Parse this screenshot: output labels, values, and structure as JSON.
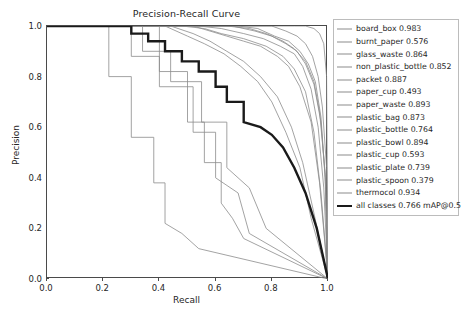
{
  "chart_data": {
    "type": "line",
    "title": "Precision-Recall Curve",
    "xlabel": "Recall",
    "ylabel": "Precision",
    "xlim": [
      0.0,
      1.0
    ],
    "ylim": [
      0.0,
      1.0
    ],
    "xticks": [
      "0.0",
      "0.2",
      "0.4",
      "0.6",
      "0.8",
      "1.0"
    ],
    "yticks": [
      "0.0",
      "0.2",
      "0.4",
      "0.6",
      "0.8",
      "1.0"
    ],
    "xtick_values": [
      0.0,
      0.2,
      0.4,
      0.6,
      0.8,
      1.0
    ],
    "ytick_values": [
      0.0,
      0.2,
      0.4,
      0.6,
      0.8,
      1.0
    ],
    "grid": false,
    "legend_position": "outside-right",
    "metric": "mAP@0.5",
    "series": [
      {
        "name": "board_box",
        "label": "board_box 0.983",
        "ap": 0.983,
        "color": "#8c8c8c",
        "width": 0.8,
        "x": [
          0.0,
          0.62,
          0.7,
          0.78,
          0.84,
          0.88,
          0.92,
          0.95,
          0.97,
          0.985,
          0.995,
          1.0
        ],
        "y": [
          1.0,
          1.0,
          1.0,
          1.0,
          1.0,
          1.0,
          1.0,
          0.99,
          0.97,
          0.93,
          0.8,
          0.0
        ]
      },
      {
        "name": "burnt_paper",
        "label": "burnt_paper 0.576",
        "ap": 0.576,
        "color": "#8c8c8c",
        "width": 0.8,
        "x": [
          0.0,
          0.3,
          0.3,
          0.4,
          0.4,
          0.52,
          0.52,
          0.6,
          0.6,
          0.68,
          0.72,
          1.0
        ],
        "y": [
          1.0,
          1.0,
          0.88,
          0.88,
          0.76,
          0.76,
          0.58,
          0.58,
          0.4,
          0.34,
          0.18,
          0.0
        ]
      },
      {
        "name": "glass_waste",
        "label": "glass_waste 0.864",
        "ap": 0.864,
        "color": "#8c8c8c",
        "width": 0.8,
        "x": [
          0.0,
          0.52,
          0.58,
          0.64,
          0.7,
          0.76,
          0.82,
          0.86,
          0.9,
          0.94,
          0.97,
          1.0
        ],
        "y": [
          1.0,
          1.0,
          0.98,
          0.96,
          0.94,
          0.92,
          0.88,
          0.84,
          0.76,
          0.62,
          0.38,
          0.0
        ]
      },
      {
        "name": "non_plastic_bottle",
        "label": "non_plastic_bottle 0.852",
        "ap": 0.852,
        "color": "#8c8c8c",
        "width": 0.8,
        "x": [
          0.0,
          0.48,
          0.56,
          0.62,
          0.7,
          0.78,
          0.84,
          0.88,
          0.92,
          0.95,
          0.975,
          1.0
        ],
        "y": [
          1.0,
          1.0,
          0.99,
          0.97,
          0.95,
          0.92,
          0.88,
          0.83,
          0.74,
          0.58,
          0.34,
          0.0
        ]
      },
      {
        "name": "packet",
        "label": "packet 0.887",
        "ap": 0.887,
        "color": "#8c8c8c",
        "width": 0.8,
        "x": [
          0.0,
          0.56,
          0.64,
          0.72,
          0.78,
          0.84,
          0.88,
          0.92,
          0.95,
          0.97,
          0.99,
          1.0
        ],
        "y": [
          1.0,
          1.0,
          1.0,
          0.99,
          0.97,
          0.94,
          0.91,
          0.86,
          0.78,
          0.66,
          0.42,
          0.0
        ]
      },
      {
        "name": "paper_cup",
        "label": "paper_cup 0.493",
        "ap": 0.493,
        "color": "#8c8c8c",
        "width": 0.8,
        "x": [
          0.0,
          0.4,
          0.4,
          0.5,
          0.5,
          0.56,
          0.56,
          0.62,
          0.62,
          0.66,
          0.7,
          1.0
        ],
        "y": [
          1.0,
          1.0,
          0.82,
          0.82,
          0.62,
          0.62,
          0.46,
          0.46,
          0.3,
          0.24,
          0.16,
          0.0
        ]
      },
      {
        "name": "paper_waste",
        "label": "paper_waste 0.893",
        "ap": 0.893,
        "color": "#8c8c8c",
        "width": 0.8,
        "x": [
          0.0,
          0.58,
          0.66,
          0.74,
          0.8,
          0.85,
          0.89,
          0.92,
          0.95,
          0.975,
          0.99,
          1.0
        ],
        "y": [
          1.0,
          1.0,
          1.0,
          0.98,
          0.96,
          0.93,
          0.9,
          0.85,
          0.77,
          0.62,
          0.4,
          0.0
        ]
      },
      {
        "name": "plastic_bag",
        "label": "plastic_bag 0.873",
        "ap": 0.873,
        "color": "#8c8c8c",
        "width": 0.8,
        "x": [
          0.0,
          0.54,
          0.62,
          0.7,
          0.77,
          0.83,
          0.88,
          0.91,
          0.94,
          0.965,
          0.985,
          1.0
        ],
        "y": [
          1.0,
          1.0,
          0.99,
          0.97,
          0.95,
          0.92,
          0.89,
          0.84,
          0.75,
          0.6,
          0.36,
          0.0
        ]
      },
      {
        "name": "plastic_bottle",
        "label": "plastic_bottle 0.764",
        "ap": 0.764,
        "color": "#8c8c8c",
        "width": 0.8,
        "x": [
          0.0,
          0.44,
          0.52,
          0.58,
          0.64,
          0.7,
          0.76,
          0.82,
          0.87,
          0.91,
          0.95,
          1.0
        ],
        "y": [
          1.0,
          1.0,
          0.97,
          0.94,
          0.9,
          0.86,
          0.8,
          0.72,
          0.6,
          0.46,
          0.26,
          0.0
        ]
      },
      {
        "name": "plastic_bowl",
        "label": "plastic_bowl 0.894",
        "ap": 0.894,
        "color": "#8c8c8c",
        "width": 0.8,
        "x": [
          0.0,
          0.6,
          0.68,
          0.75,
          0.81,
          0.86,
          0.9,
          0.93,
          0.955,
          0.975,
          0.99,
          1.0
        ],
        "y": [
          1.0,
          1.0,
          1.0,
          0.99,
          0.96,
          0.94,
          0.9,
          0.85,
          0.78,
          0.64,
          0.4,
          0.0
        ]
      },
      {
        "name": "plastic_cup",
        "label": "plastic_cup 0.593",
        "ap": 0.593,
        "color": "#8c8c8c",
        "width": 0.8,
        "x": [
          0.0,
          0.34,
          0.34,
          0.44,
          0.44,
          0.55,
          0.55,
          0.64,
          0.64,
          0.72,
          0.78,
          1.0
        ],
        "y": [
          1.0,
          1.0,
          0.9,
          0.9,
          0.78,
          0.78,
          0.62,
          0.62,
          0.44,
          0.36,
          0.2,
          0.0
        ]
      },
      {
        "name": "plastic_plate",
        "label": "plastic_plate 0.739",
        "ap": 0.739,
        "color": "#8c8c8c",
        "width": 0.8,
        "x": [
          0.0,
          0.42,
          0.5,
          0.56,
          0.63,
          0.69,
          0.75,
          0.8,
          0.85,
          0.9,
          0.94,
          1.0
        ],
        "y": [
          1.0,
          1.0,
          0.96,
          0.93,
          0.89,
          0.84,
          0.78,
          0.7,
          0.58,
          0.44,
          0.24,
          0.0
        ]
      },
      {
        "name": "plastic_spoon",
        "label": "plastic_spoon 0.379",
        "ap": 0.379,
        "color": "#8c8c8c",
        "width": 0.8,
        "x": [
          0.0,
          0.22,
          0.22,
          0.3,
          0.3,
          0.38,
          0.38,
          0.42,
          0.42,
          0.48,
          0.54,
          1.0
        ],
        "y": [
          1.0,
          1.0,
          0.8,
          0.8,
          0.56,
          0.56,
          0.38,
          0.38,
          0.22,
          0.18,
          0.12,
          0.0
        ]
      },
      {
        "name": "thermocol",
        "label": "thermocol 0.934",
        "ap": 0.934,
        "color": "#8c8c8c",
        "width": 0.8,
        "x": [
          0.0,
          0.66,
          0.74,
          0.8,
          0.85,
          0.89,
          0.92,
          0.945,
          0.965,
          0.98,
          0.995,
          1.0
        ],
        "y": [
          1.0,
          1.0,
          1.0,
          1.0,
          0.98,
          0.96,
          0.93,
          0.88,
          0.8,
          0.68,
          0.44,
          0.0
        ]
      },
      {
        "name": "all_classes",
        "label": "all classes 0.766 mAP@0.5",
        "ap": 0.766,
        "color": "#1a1a1a",
        "width": 2.4,
        "x": [
          0.0,
          0.3,
          0.3,
          0.36,
          0.36,
          0.42,
          0.42,
          0.48,
          0.48,
          0.54,
          0.54,
          0.6,
          0.6,
          0.64,
          0.64,
          0.7,
          0.7,
          0.76,
          0.8,
          0.84,
          0.88,
          0.92,
          0.96,
          1.0
        ],
        "y": [
          1.0,
          1.0,
          0.97,
          0.97,
          0.94,
          0.94,
          0.9,
          0.9,
          0.86,
          0.86,
          0.82,
          0.82,
          0.76,
          0.76,
          0.7,
          0.7,
          0.62,
          0.6,
          0.57,
          0.52,
          0.44,
          0.34,
          0.2,
          0.0
        ]
      }
    ]
  }
}
